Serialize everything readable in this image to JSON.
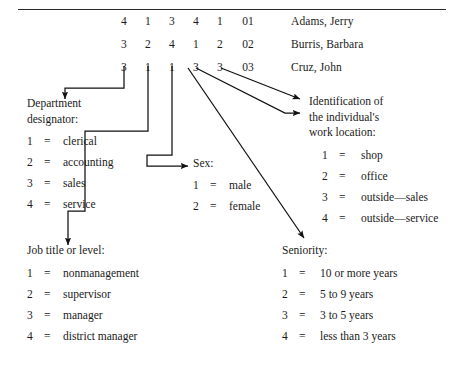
{
  "record": {
    "columns": [
      "department",
      "job_title",
      "sex",
      "work_location",
      "seniority",
      "id"
    ],
    "rows": [
      {
        "department": "4",
        "job_title": "1",
        "sex": "3",
        "work_location": "4",
        "seniority": "1",
        "id": "01",
        "name": "Adams, Jerry"
      },
      {
        "department": "3",
        "job_title": "2",
        "sex": "4",
        "work_location": "1",
        "seniority": "2",
        "id": "02",
        "name": "Burris, Barbara"
      },
      {
        "department": "3",
        "job_title": "1",
        "sex": "1",
        "work_location": "3",
        "seniority": "3",
        "id": "03",
        "name": "Cruz, John"
      }
    ]
  },
  "legends": {
    "department": {
      "heading": [
        "Department",
        "designator:"
      ],
      "entries": [
        {
          "key": "1",
          "eq": "=",
          "value": "clerical"
        },
        {
          "key": "2",
          "eq": "=",
          "value": "accounting"
        },
        {
          "key": "3",
          "eq": "=",
          "value": "sales"
        },
        {
          "key": "4",
          "eq": "=",
          "value": "service"
        }
      ]
    },
    "sex": {
      "heading": [
        "Sex:"
      ],
      "entries": [
        {
          "key": "1",
          "eq": "=",
          "value": "male"
        },
        {
          "key": "2",
          "eq": "=",
          "value": "female"
        }
      ]
    },
    "work_location": {
      "heading": [
        "Identification of",
        "the individual's",
        "work location:"
      ],
      "entries": [
        {
          "key": "1",
          "eq": "=",
          "value": "shop"
        },
        {
          "key": "2",
          "eq": "=",
          "value": "office"
        },
        {
          "key": "3",
          "eq": "=",
          "value": "outside—sales"
        },
        {
          "key": "4",
          "eq": "=",
          "value": "outside—service"
        }
      ]
    },
    "job_title": {
      "heading": [
        "Job title or level:"
      ],
      "entries": [
        {
          "key": "1",
          "eq": "=",
          "value": "nonmanagement"
        },
        {
          "key": "2",
          "eq": "=",
          "value": "supervisor"
        },
        {
          "key": "3",
          "eq": "=",
          "value": "manager"
        },
        {
          "key": "4",
          "eq": "=",
          "value": "district manager"
        }
      ]
    },
    "seniority": {
      "heading": [
        "Seniority:"
      ],
      "entries": [
        {
          "key": "1",
          "eq": "=",
          "value": "10 or more years"
        },
        {
          "key": "2",
          "eq": "=",
          "value": "5 to 9 years"
        },
        {
          "key": "3",
          "eq": "=",
          "value": "3 to 5 years"
        },
        {
          "key": "4",
          "eq": "=",
          "value": "less than 3 years"
        }
      ]
    }
  },
  "colors": {
    "ink": "#1a1a1a",
    "rule": "#2b2b2b",
    "leader": "#111111",
    "background": "#ffffff"
  }
}
